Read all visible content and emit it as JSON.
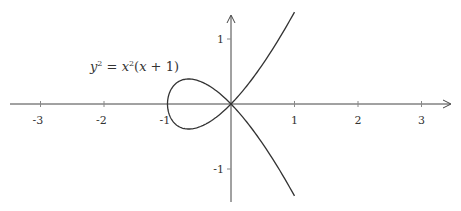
{
  "chart_data": {
    "type": "line",
    "title": "",
    "annotation": "y² = x²(x + 1)",
    "equation": {
      "base": "y",
      "exp": "2",
      "eq": " = ",
      "rhs_base": "x",
      "rhs_exp": "2",
      "rhs_tail": "(x + 1)"
    },
    "xlabel": "",
    "ylabel": "",
    "xlim": [
      -3.5,
      3.2
    ],
    "ylim": [
      -1.5,
      1.45
    ],
    "x_ticks": [
      -3,
      -2,
      -1,
      1,
      2,
      3
    ],
    "x_tick_labels": [
      "-3",
      "-2",
      "-1",
      "1",
      "2",
      "3"
    ],
    "y_ticks": [
      1,
      -1
    ],
    "y_tick_labels": [
      "1",
      "-1"
    ],
    "grid": false,
    "legend": "none",
    "series": [
      {
        "name": "upper branch",
        "x": [
          -1,
          -0.75,
          -0.5,
          -0.25,
          0,
          0.25,
          0.5,
          0.75,
          1
        ],
        "values": [
          0,
          0.375,
          0.354,
          0.217,
          0,
          0.28,
          0.612,
          0.992,
          1.414
        ]
      },
      {
        "name": "lower branch",
        "x": [
          -1,
          -0.75,
          -0.5,
          -0.25,
          0,
          0.25,
          0.5,
          0.75,
          1
        ],
        "values": [
          0,
          -0.375,
          -0.354,
          -0.217,
          0,
          -0.28,
          -0.612,
          -0.992,
          -1.414
        ]
      }
    ],
    "colors": {
      "axis": "#333333",
      "curve": "#333333"
    }
  }
}
